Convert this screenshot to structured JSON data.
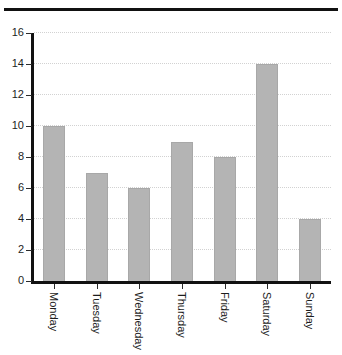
{
  "chart_data": {
    "type": "bar",
    "title": "",
    "xlabel": "",
    "ylabel": "",
    "categories": [
      "Monday",
      "Tuesday",
      "Wednesday",
      "Thursday",
      "Friday",
      "Saturday",
      "Sunday"
    ],
    "values": [
      10,
      7,
      6,
      9,
      8,
      14,
      4
    ],
    "ylim": [
      0,
      16
    ],
    "ytick_labels": [
      "0",
      "2",
      "4",
      "6",
      "8",
      "10",
      "12",
      "14",
      "16"
    ],
    "ytick_values": [
      0,
      2,
      4,
      6,
      8,
      10,
      12,
      14,
      16
    ],
    "grid": true,
    "grid_axis": "y",
    "legend": "none",
    "bar_color": "#b4b4b4",
    "axis_color": "#111111",
    "grid_color": "#d2d2d2",
    "background_color": "#ffffff"
  },
  "decoration": {
    "top_rule_color": "#111111",
    "clipped_title_fragment": "."
  }
}
